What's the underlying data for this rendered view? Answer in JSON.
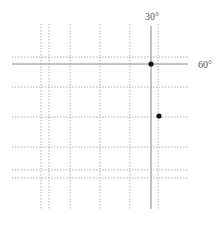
{
  "diagram": {
    "labels": {
      "vertical_solid": "30°",
      "horizontal_solid": "60°"
    },
    "colors": {
      "solid": "#888888",
      "dotted": "#b0b0b0",
      "dot": "#111111",
      "label": "#555555"
    },
    "vertical_dotted_x": [
      41,
      49,
      70,
      100,
      130,
      158
    ],
    "horizontal_dotted_y": [
      57,
      87,
      117,
      147,
      170,
      178
    ],
    "vertical_solid_x": 151,
    "horizontal_solid_y": 64,
    "points": [
      {
        "x": 151,
        "y": 64
      },
      {
        "x": 159,
        "y": 116
      }
    ]
  }
}
